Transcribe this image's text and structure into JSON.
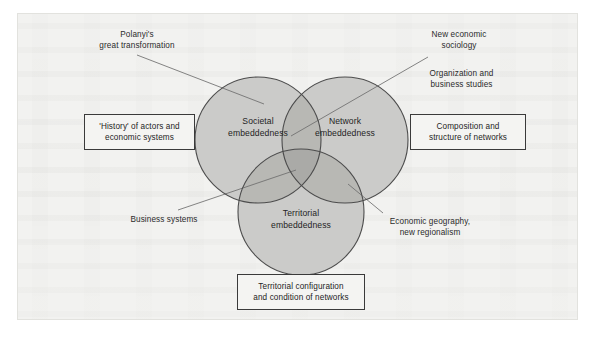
{
  "figure": {
    "type": "venn-diagram-3-set",
    "background_color": "#f2f2f0",
    "frame_color": "#e2e2de"
  },
  "venn": {
    "fill_color": "#c9c9c7",
    "stroke_color": "#4c4c4c",
    "sets": [
      {
        "id": "societal",
        "label": "Societal\nembeddedness",
        "cx": 258,
        "cy": 140,
        "r": 63
      },
      {
        "id": "network",
        "label": "Network\nembeddedness",
        "cx": 345,
        "cy": 140,
        "r": 63
      },
      {
        "id": "territorial",
        "label": "Territorial\nembeddedness",
        "cx": 301,
        "cy": 212,
        "r": 63
      }
    ]
  },
  "annotations": [
    {
      "id": "polanyi",
      "label": "Polanyi's\ngreat transformation",
      "points_to": "societal"
    },
    {
      "id": "new-economic-sociology",
      "label": "New economic\nsociology",
      "points_to": "network"
    },
    {
      "id": "organization-business-studies",
      "label": "Organization and\nbusiness studies",
      "points_to": "network"
    },
    {
      "id": "business-systems",
      "label": "Business systems",
      "points_to": "societal-territorial-overlap"
    },
    {
      "id": "economic-geography",
      "label": "Economic geography,\nnew regionalism",
      "points_to": "territorial"
    }
  ],
  "callouts": [
    {
      "id": "history-of-actors",
      "label": "'History' of actors and\neconomic systems",
      "position": "left"
    },
    {
      "id": "composition-structure",
      "label": "Composition and\nstructure of networks",
      "position": "right"
    },
    {
      "id": "territorial-configuration",
      "label": "Territorial configuration\nand condition of networks",
      "position": "bottom"
    }
  ]
}
